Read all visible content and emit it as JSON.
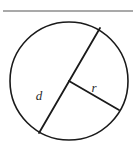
{
  "figure": {
    "background_color": "#ffffff",
    "top_rule": {
      "color": "#8c8c8c",
      "thickness": 1.5,
      "x_start": 3,
      "x_end": 133,
      "y": 11
    },
    "circle": {
      "stroke_color": "#1a1a1a",
      "stroke_width": 1.6,
      "center_x": 69,
      "center_y": 81,
      "radius": 59,
      "fill": "none"
    },
    "segments": [
      {
        "name": "diameter",
        "label": "d",
        "stroke_color": "#1a1a1a",
        "stroke_width": 1.8,
        "x1": 100,
        "y1": 28,
        "x2": 39,
        "y2": 133
      },
      {
        "name": "radius",
        "label": "r",
        "stroke_color": "#1a1a1a",
        "stroke_width": 1.8,
        "x1": 69,
        "y1": 81,
        "x2": 119,
        "y2": 110
      }
    ],
    "labels": [
      {
        "name": "diameter-label",
        "text": "d",
        "x": 39,
        "y": 100,
        "color": "#2b2b2b"
      },
      {
        "name": "radius-label",
        "text": "r",
        "x": 94,
        "y": 92,
        "color": "#2b2b2b"
      }
    ]
  }
}
